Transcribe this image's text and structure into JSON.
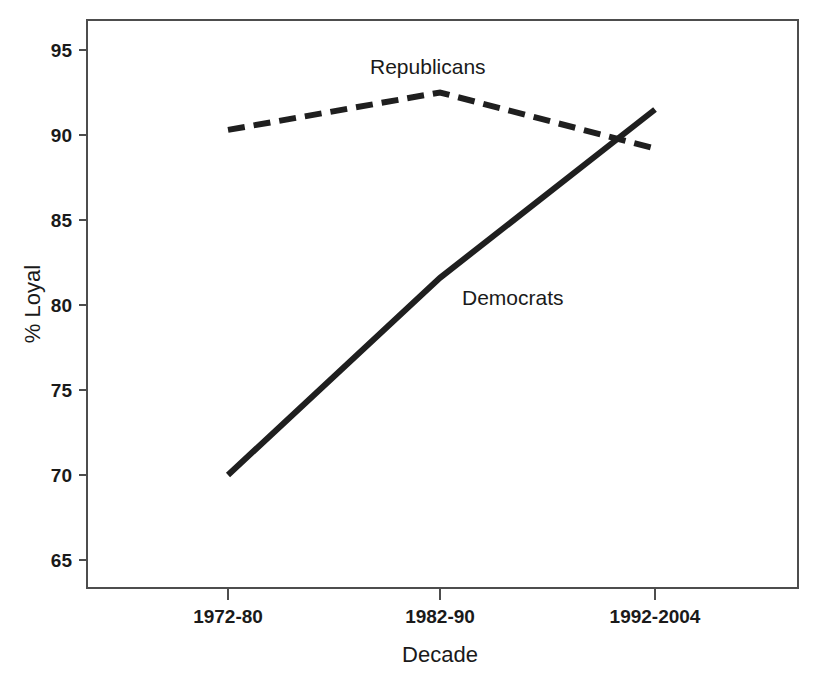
{
  "chart_data": {
    "type": "line",
    "title": "",
    "xlabel": "Decade",
    "ylabel": "% Loyal",
    "categories": [
      "1972-80",
      "1982-90",
      "1992-2004"
    ],
    "ylim": [
      63.5,
      96.5
    ],
    "yticks": [
      65,
      70,
      75,
      80,
      85,
      90,
      95
    ],
    "ytick_labels": [
      "65",
      "70",
      "75",
      "80",
      "85",
      "90",
      "95"
    ],
    "grid": false,
    "legend_position": "inline-annotations",
    "series": [
      {
        "name": "Republicans",
        "style": "dashed",
        "color": "#1f1f1f",
        "values": [
          90.3,
          92.5,
          89.2
        ]
      },
      {
        "name": "Democrats",
        "style": "solid",
        "color": "#1f1f1f",
        "values": [
          70.0,
          81.6,
          91.5
        ]
      }
    ],
    "annotations": [
      {
        "text": "Republicans",
        "x_px": 370,
        "y_px": 74
      },
      {
        "text": "Democrats",
        "x_px": 462,
        "y_px": 305
      }
    ]
  },
  "axis": {
    "y_label": "% Loyal",
    "x_label": "Decade",
    "y_ticks": {
      "t0": "65",
      "t1": "70",
      "t2": "75",
      "t3": "80",
      "t4": "85",
      "t5": "90",
      "t6": "95"
    },
    "x_ticks": {
      "t0": "1972-80",
      "t1": "1982-90",
      "t2": "1992-2004"
    }
  },
  "series_labels": {
    "republicans": "Republicans",
    "democrats": "Democrats"
  }
}
